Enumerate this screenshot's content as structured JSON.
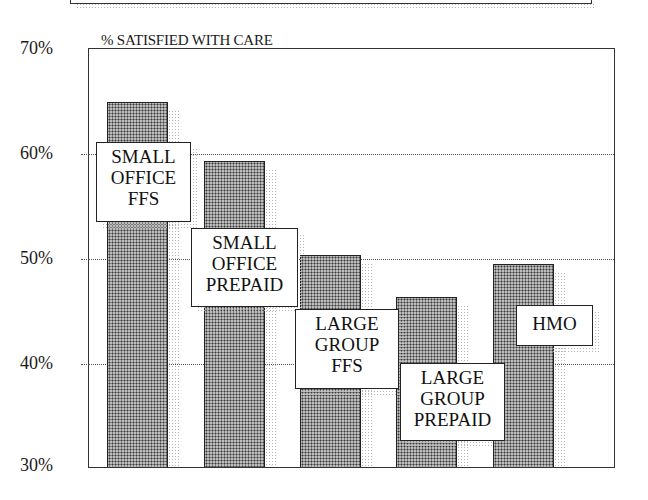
{
  "chart_data": {
    "type": "bar",
    "title": "% SATISFIED WITH CARE",
    "xlabel": "",
    "ylabel": "% SATISFIED WITH CARE",
    "ylim": [
      30,
      70
    ],
    "yticks": [
      "70%",
      "60%",
      "50%",
      "40%",
      "30%"
    ],
    "grid": "dotted horizontal at 40%, 50%, 60%",
    "legend": "none (categories labeled in boxes on bars)",
    "categories": [
      "SMALL OFFICE FFS",
      "SMALL OFFICE PREPAID",
      "LARGE GROUP FFS",
      "LARGE GROUP PREPAID",
      "HMO"
    ],
    "values": [
      64.8,
      59.1,
      50.2,
      46.2,
      49.3
    ],
    "labels": [
      {
        "lines": [
          "SMALL",
          "OFFICE",
          "FFS"
        ]
      },
      {
        "lines": [
          "SMALL",
          "OFFICE",
          "PREPAID"
        ]
      },
      {
        "lines": [
          "LARGE",
          "GROUP",
          "FFS"
        ]
      },
      {
        "lines": [
          "LARGE",
          "GROUP",
          "PREPAID"
        ]
      },
      {
        "lines": [
          "HMO"
        ]
      }
    ]
  },
  "colors": {
    "bar_fill": "#bdbdbd",
    "bar_dots": "#3a3a3a",
    "axis": "#333333",
    "grid": "#555555",
    "background": "#ffffff"
  }
}
